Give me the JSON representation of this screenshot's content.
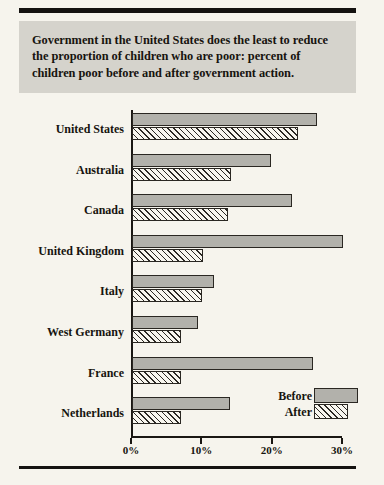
{
  "title": {
    "line1": "Government in the United States does the least to reduce",
    "line2": "the proportion of children who are poor: percent of",
    "line3": "children poor before and after government action."
  },
  "legend": {
    "before_label": "Before",
    "after_label": "After"
  },
  "colors": {
    "page_background": "#f6f4ed",
    "title_banner": "#d5d3cc",
    "before_bar": "#b2b1ab",
    "after_bar_hatch": "#2b2824",
    "ink": "#17140f"
  },
  "chart_data": {
    "type": "bar",
    "orientation": "horizontal",
    "title": "Government in the United States does the least to reduce the proportion of children who are poor: percent of children poor before and after government action.",
    "xlabel": "",
    "ylabel": "",
    "xlim": [
      0,
      30
    ],
    "grid": false,
    "legend_position": "bottom-right",
    "tick_labels": [
      "0%",
      "10%",
      "20%",
      "30%"
    ],
    "tick_values": [
      0,
      10,
      20,
      30
    ],
    "categories": [
      "United States",
      "Australia",
      "Canada",
      "United Kingdom",
      "Italy",
      "West Germany",
      "France",
      "Netherlands"
    ],
    "series": [
      {
        "name": "Before",
        "values": [
          26.3,
          19.8,
          22.7,
          30.0,
          11.6,
          9.4,
          25.7,
          14.0
        ]
      },
      {
        "name": "After",
        "values": [
          23.6,
          14.1,
          13.6,
          10.1,
          9.9,
          7.0,
          7.0,
          6.9
        ]
      }
    ]
  }
}
